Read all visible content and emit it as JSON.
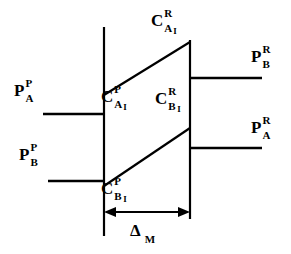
{
  "figure": {
    "background_color": "#ffffff",
    "line_color": "#000000",
    "labels": {
      "top_center": {
        "base": "C",
        "sup": "R",
        "sub": "A",
        "sub2": "I"
      },
      "left_mid": {
        "base": "C",
        "sup": "P",
        "sub": "A",
        "sub2": "I"
      },
      "center_mid": {
        "base": "C",
        "sup": "R",
        "sub": "B",
        "sub2": "I"
      },
      "bottom_left": {
        "base": "C",
        "sup": "P",
        "sub": "B",
        "sub2": "I"
      },
      "left_upper": {
        "base": "P",
        "sup": "P",
        "sub": "A",
        "sub2": ""
      },
      "left_lower": {
        "base": "P",
        "sup": "P",
        "sub": "B",
        "sub2": ""
      },
      "right_upper": {
        "base": "P",
        "sup": "R",
        "sub": "B",
        "sub2": ""
      },
      "right_lower": {
        "base": "P",
        "sup": "R",
        "sub": "A",
        "sub2": ""
      },
      "dimension": {
        "base": "Δ",
        "sup": "",
        "sub": "M",
        "sub2": ""
      }
    },
    "geometry": {
      "left_wall_x": 104,
      "right_wall_x": 190,
      "left_wall_top_y": 27,
      "left_wall_bottom_y": 236,
      "right_wall_top_y": 40,
      "right_wall_bottom_y": 219,
      "upper_diagonal": [
        104,
        95,
        190,
        42
      ],
      "lower_diagonal": [
        104,
        186,
        190,
        128
      ],
      "incoming_upper": [
        43,
        114,
        104,
        114
      ],
      "incoming_lower": [
        48,
        181,
        104,
        181
      ],
      "outgoing_upper": [
        190,
        78,
        262,
        78
      ],
      "outgoing_lower": [
        190,
        148,
        262,
        148
      ],
      "dimension_arrow_y": 212
    }
  }
}
